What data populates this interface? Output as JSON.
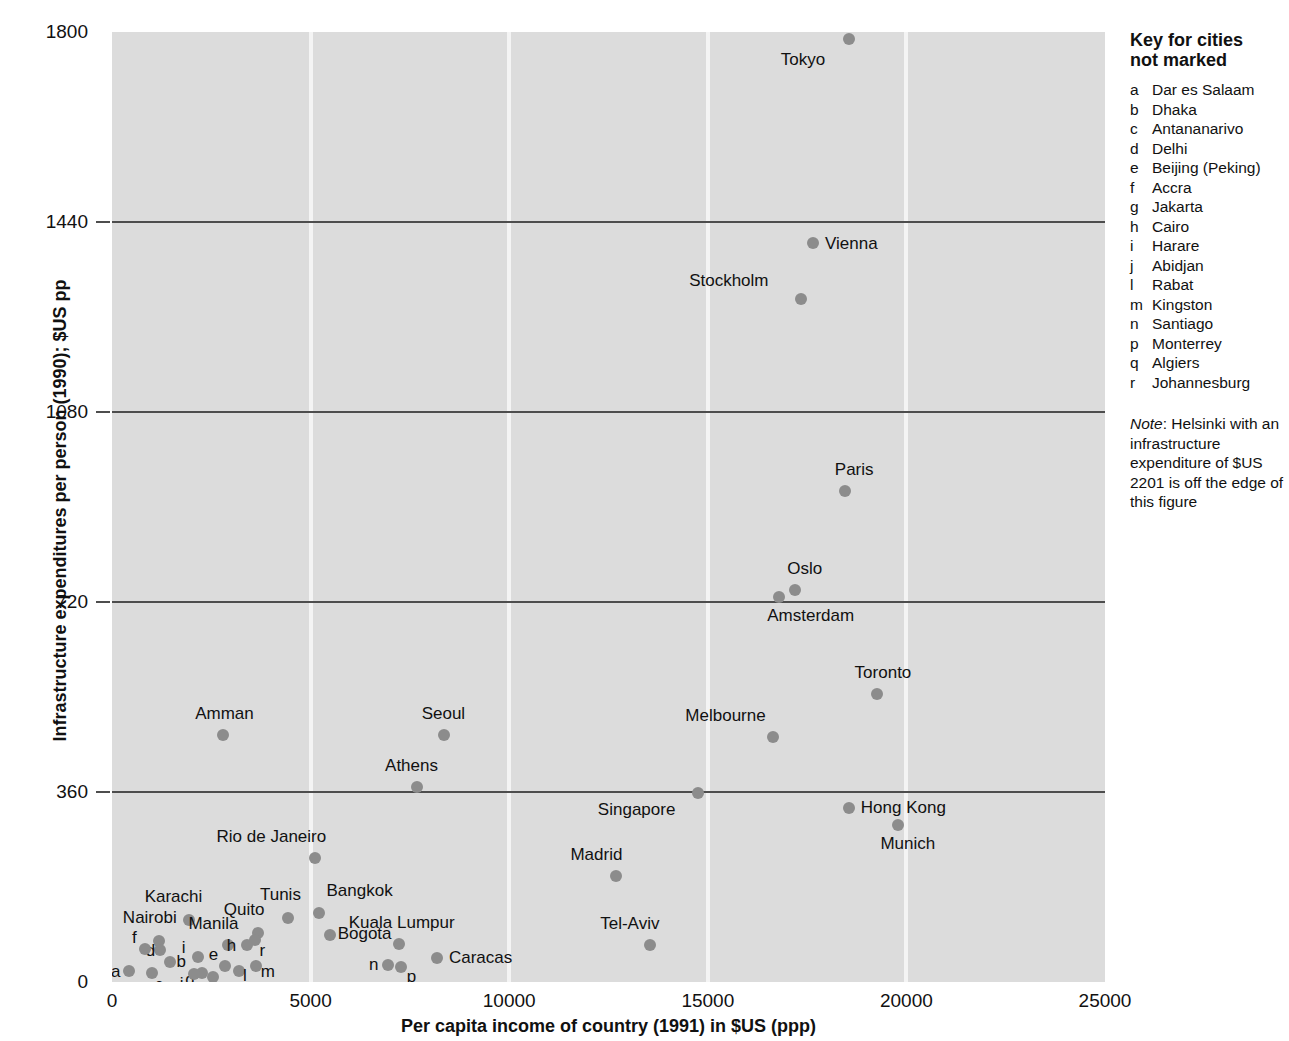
{
  "chart_data": {
    "type": "scatter",
    "title": "",
    "xlabel": "Per capita income of country (1991) in $US (ppp)",
    "ylabel": "Infrastructure expenditures per person (1990); $US pp",
    "xlim": [
      0,
      25000
    ],
    "ylim": [
      0,
      1800
    ],
    "xticks": [
      "0",
      "5000",
      "10000",
      "15000",
      "20000",
      "25000"
    ],
    "xtick_values": [
      0,
      5000,
      10000,
      15000,
      20000,
      25000
    ],
    "yticks": [
      "0",
      "360",
      "720",
      "1080",
      "1440",
      "1800"
    ],
    "ytick_values": [
      0,
      360,
      720,
      1080,
      1440,
      1800
    ],
    "grid": "vertical white gridlines at 5000/10000/15000/20000; horizontal dark gridlines at 360/720/1080/1440",
    "legend_position": "right panel",
    "point_color": "#8c8c8c",
    "plot_background": "#dcdcdc",
    "points": [
      {
        "label": "Tokyo",
        "x": 18550,
        "y": 1787,
        "lx": -68,
        "ly": 12
      },
      {
        "label": "Vienna",
        "x": 17650,
        "y": 1400,
        "lx": 12,
        "ly": -8
      },
      {
        "label": "Stockholm",
        "x": 17350,
        "y": 1295,
        "lx": -112,
        "ly": -27
      },
      {
        "label": "Paris",
        "x": 18450,
        "y": 930,
        "lx": -10,
        "ly": -30
      },
      {
        "label": "Oslo",
        "x": 17200,
        "y": 742,
        "lx": -8,
        "ly": -30
      },
      {
        "label": "Amsterdam",
        "x": 16800,
        "y": 730,
        "lx": -12,
        "ly": 10
      },
      {
        "label": "Toronto",
        "x": 19250,
        "y": 545,
        "lx": -22,
        "ly": -30
      },
      {
        "label": "Melbourne",
        "x": 16650,
        "y": 465,
        "lx": -88,
        "ly": -30
      },
      {
        "label": "Singapore",
        "x": 14750,
        "y": 358,
        "lx": -100,
        "ly": 8
      },
      {
        "label": "Hong Kong",
        "x": 18550,
        "y": 330,
        "lx": 12,
        "ly": -9
      },
      {
        "label": "Munich",
        "x": 19800,
        "y": 298,
        "lx": -18,
        "ly": 10
      },
      {
        "label": "Amman",
        "x": 2800,
        "y": 468,
        "lx": -28,
        "ly": -30
      },
      {
        "label": "Seoul",
        "x": 8350,
        "y": 468,
        "lx": -22,
        "ly": -30
      },
      {
        "label": "Athens",
        "x": 7680,
        "y": 370,
        "lx": -32,
        "ly": -30
      },
      {
        "label": "Rio de Janeiro",
        "x": 5100,
        "y": 235,
        "lx": -98,
        "ly": -30
      },
      {
        "label": "Madrid",
        "x": 12700,
        "y": 200,
        "lx": -46,
        "ly": -30
      },
      {
        "label": "Tel-Aviv",
        "x": 13550,
        "y": 70,
        "lx": -50,
        "ly": -30
      },
      {
        "label": "Bangkok",
        "x": 5200,
        "y": 130,
        "lx": 8,
        "ly": -31
      },
      {
        "label": "Bogota",
        "x": 5480,
        "y": 90,
        "lx": 8,
        "ly": -10
      },
      {
        "label": "Tunis",
        "x": 4430,
        "y": 122,
        "lx": -28,
        "ly": -32
      },
      {
        "label": "Quito",
        "x": 3670,
        "y": 92,
        "lx": -34,
        "ly": -32
      },
      {
        "label": "Karachi",
        "x": 1930,
        "y": 118,
        "lx": -44,
        "ly": -32
      },
      {
        "label": "Nairobi",
        "x": 1180,
        "y": 78,
        "lx": -36,
        "ly": -32
      },
      {
        "label": "Manila",
        "x": 2930,
        "y": 70,
        "lx": -40,
        "ly": -30
      },
      {
        "label": "Kuala Lumpur",
        "x": 7220,
        "y": 72,
        "lx": -50,
        "ly": -30
      },
      {
        "label": "Caracas",
        "x": 8180,
        "y": 45,
        "lx": 12,
        "ly": -9
      }
    ],
    "key_points": [
      {
        "label": "a",
        "x": 430,
        "y": 20,
        "lx": -18,
        "ly": -8
      },
      {
        "label": "b",
        "x": 1450,
        "y": 38,
        "lx": 7,
        "ly": -9
      },
      {
        "label": "c",
        "x": 1000,
        "y": 17,
        "lx": 3,
        "ly": 3
      },
      {
        "label": "d",
        "x": 1200,
        "y": 60,
        "lx": -14,
        "ly": -8
      },
      {
        "label": "e",
        "x": 2840,
        "y": 30,
        "lx": -16,
        "ly": -20
      },
      {
        "label": "f",
        "x": 830,
        "y": 62,
        "lx": -13,
        "ly": -20
      },
      {
        "label": "g",
        "x": 2270,
        "y": 18,
        "lx": -17,
        "ly": -2
      },
      {
        "label": "h",
        "x": 3390,
        "y": 70,
        "lx": -20,
        "ly": -8
      },
      {
        "label": "i",
        "x": 2160,
        "y": 48,
        "lx": -16,
        "ly": -18
      },
      {
        "label": "j",
        "x": 2060,
        "y": 15,
        "lx": -14,
        "ly": 1
      },
      {
        "label": "l",
        "x": 3200,
        "y": 20,
        "lx": 4,
        "ly": -4
      },
      {
        "label": "m",
        "x": 3620,
        "y": 30,
        "lx": 5,
        "ly": -3
      },
      {
        "label": "n",
        "x": 6950,
        "y": 32,
        "lx": -19,
        "ly": -9
      },
      {
        "label": "p",
        "x": 7270,
        "y": 28,
        "lx": 6,
        "ly": 1
      },
      {
        "label": "q",
        "x": 2540,
        "y": 10,
        "lx": -6,
        "ly": 3
      },
      {
        "label": "r",
        "x": 3590,
        "y": 80,
        "lx": 5,
        "ly": 2
      }
    ]
  },
  "key_panel": {
    "title_line1": "Key for cities",
    "title_line2": "not marked",
    "entries": [
      {
        "letter": "a",
        "city": "Dar es Salaam"
      },
      {
        "letter": "b",
        "city": "Dhaka"
      },
      {
        "letter": "c",
        "city": "Antananarivo"
      },
      {
        "letter": "d",
        "city": "Delhi"
      },
      {
        "letter": "e",
        "city": "Beijing (Peking)"
      },
      {
        "letter": "f",
        "city": "Accra"
      },
      {
        "letter": "g",
        "city": "Jakarta"
      },
      {
        "letter": "h",
        "city": "Cairo"
      },
      {
        "letter": "i",
        "city": "Harare"
      },
      {
        "letter": "j",
        "city": "Abidjan"
      },
      {
        "letter": "l",
        "city": "Rabat"
      },
      {
        "letter": "m",
        "city": "Kingston"
      },
      {
        "letter": "n",
        "city": "Santiago"
      },
      {
        "letter": "p",
        "city": "Monterrey"
      },
      {
        "letter": "q",
        "city": "Algiers"
      },
      {
        "letter": "r",
        "city": "Johannesburg"
      }
    ],
    "note_label": "Note",
    "note_text": ": Helsinki with an infrastructure expenditure of $US 2201 is off the edge of this figure"
  }
}
